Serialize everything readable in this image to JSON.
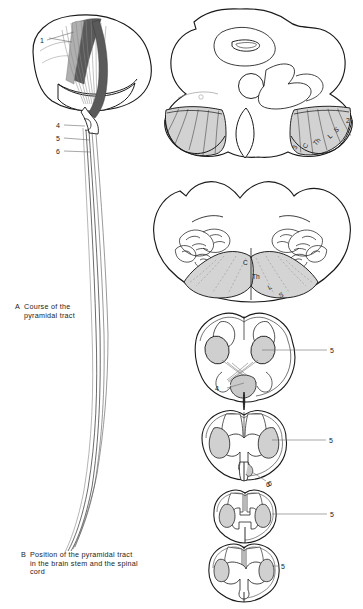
{
  "plate": {
    "title": "Pyramidal tract anatomical plate",
    "background": "#ffffff",
    "ink": "#1a1a1a",
    "fiber_gray": "#8c8c8c",
    "tract_fill": "#c9c9c9",
    "band_fill": "#d2d2d2",
    "capsule_dark": "#6f6f6f"
  },
  "captions": {
    "a": {
      "letter": "A",
      "line1": "Course of the",
      "line2": "pyramidal tract"
    },
    "b": {
      "letter": "B",
      "line1": "Position of the pyramidal tract",
      "line2": "in the brain stem and the spinal",
      "line3": "cord"
    }
  },
  "panel_a": {
    "name": "course-of-pyramidal-tract",
    "leaders": [
      {
        "label": "1",
        "x": 42,
        "y": 41,
        "line_to_x": 73,
        "line_to_y": 33
      },
      {
        "label": "4",
        "x": 59,
        "y": 125,
        "line_to_x": 84,
        "line_to_y": 125
      },
      {
        "label": "5",
        "x": 59,
        "y": 138,
        "line_to_x": 88,
        "line_to_y": 138
      },
      {
        "label": "6",
        "x": 59,
        "y": 151,
        "line_to_x": 88,
        "line_to_y": 151
      }
    ]
  },
  "panel_b": {
    "name": "position-in-brainstem-and-cord",
    "sections": [
      {
        "id": "midbrain",
        "title": "midbrain-cerebral-peduncle",
        "somatotopy": [
          {
            "label": "3",
            "x": 299,
            "y": 149,
            "rot": -62
          },
          {
            "label": "C",
            "x": 310,
            "y": 147,
            "rot": -60
          },
          {
            "label": "Th",
            "x": 322,
            "y": 143,
            "rot": -52
          },
          {
            "label": "L",
            "x": 334,
            "y": 136,
            "rot": -42
          },
          {
            "label": "S",
            "x": 340,
            "y": 130,
            "rot": -36
          },
          {
            "label": "2",
            "x": 349,
            "y": 120,
            "rot": 0
          }
        ]
      },
      {
        "id": "medulla",
        "title": "medulla-pyramids",
        "somatotopy": [
          {
            "label": "C",
            "x": 246,
            "y": 262,
            "rot": 0
          },
          {
            "label": "Th",
            "x": 256,
            "y": 276,
            "rot": 0
          },
          {
            "label": "L",
            "x": 272,
            "y": 288,
            "rot": -28
          },
          {
            "label": "S",
            "x": 283,
            "y": 296,
            "rot": -28
          }
        ]
      },
      {
        "id": "decussation",
        "title": "pyramidal-decussation",
        "leaders": [
          {
            "label": "5",
            "x": 332,
            "y": 350,
            "tx": 257,
            "ty": 350
          },
          {
            "label": "4",
            "x": 218,
            "y": 388,
            "tx": 243,
            "ty": 383
          }
        ]
      },
      {
        "id": "cervical",
        "title": "cervical-spinal-cord",
        "leaders": [
          {
            "label": "5",
            "x": 331,
            "y": 439,
            "tx": 270,
            "ty": 439
          },
          {
            "label": "6",
            "x": 271,
            "y": 481,
            "tx": 254,
            "ty": 470
          }
        ]
      },
      {
        "id": "thoracic",
        "title": "thoracic-spinal-cord",
        "leaders": [
          {
            "label": "5",
            "x": 332,
            "y": 513,
            "tx": 278,
            "ty": 513
          }
        ]
      },
      {
        "id": "lumbosacral",
        "title": "lumbosacral-spinal-cord",
        "leaders": [
          {
            "label": "5",
            "x": 283,
            "y": 566,
            "tx": 261,
            "ty": 566
          }
        ]
      }
    ]
  }
}
